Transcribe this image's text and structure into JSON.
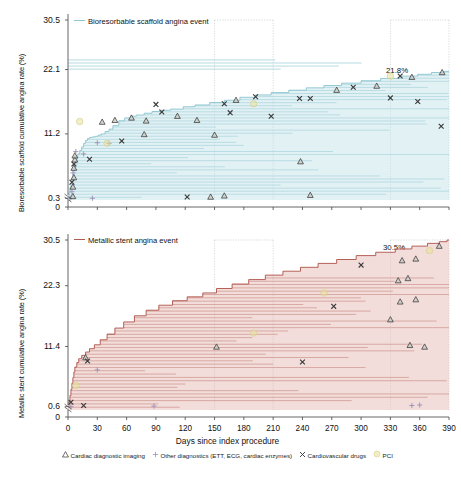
{
  "figure": {
    "xaxis": {
      "title": "Days since index procedure",
      "ticks": [
        0,
        30,
        60,
        90,
        120,
        150,
        180,
        210,
        240,
        270,
        300,
        330,
        360,
        390
      ],
      "min": 0,
      "max": 390
    },
    "marker_legend": [
      {
        "glyph": "triangle",
        "label": "Cardiac diagnostic imaging"
      },
      {
        "glyph": "plus",
        "label": "Other diagnostics (ETT, ECG, cardiac enzymes)"
      },
      {
        "glyph": "cross",
        "label": "Cardiovascular drugs"
      },
      {
        "glyph": "circle",
        "label": "PCI"
      }
    ],
    "colors": {
      "scaffold": "#8ec6d2",
      "scaffold_fill": "#bfe0e6",
      "stent": "#b05a50",
      "stent_fill": "#e3b4ad",
      "pci": "#e8e2a0",
      "gridline": "#bfc9cc",
      "axis": "#555555"
    }
  },
  "chart_data": [
    {
      "id": "top",
      "type": "area",
      "title": "Bioresorbable scaffold angina event",
      "ylabel": "Bioresorbable scaffold cumulative angina rate (%)",
      "xlabel": "Days since index procedure",
      "yticks": [
        0,
        0.3,
        11.2,
        22.1,
        30.5
      ],
      "ylim": [
        0,
        30.5
      ],
      "axis_break": true,
      "final_label": "21.8%",
      "final_value": 21.8,
      "grid": "vertical-dotted",
      "gridlines_x": [
        150,
        210,
        330,
        390
      ],
      "legend_position": "top-left-inline",
      "step_curve": {
        "x": [
          0,
          1,
          2,
          3,
          4,
          5,
          6,
          7,
          8,
          9,
          10,
          12,
          14,
          16,
          18,
          20,
          22,
          25,
          28,
          31,
          34,
          38,
          42,
          46,
          52,
          58,
          64,
          70,
          78,
          86,
          95,
          105,
          118,
          130,
          145,
          160,
          176,
          192,
          208,
          226,
          244,
          262,
          280,
          300,
          320,
          340,
          358,
          372,
          385,
          390
        ],
        "y": [
          0.3,
          1.2,
          2.1,
          2.9,
          3.6,
          4.3,
          5.0,
          5.7,
          6.4,
          7.1,
          7.8,
          8.4,
          9.0,
          9.6,
          10.1,
          10.4,
          10.6,
          10.7,
          10.8,
          11.0,
          11.2,
          11.6,
          12.0,
          12.6,
          13.4,
          13.9,
          14.2,
          14.4,
          14.7,
          15.0,
          15.2,
          15.4,
          15.8,
          16.1,
          16.5,
          16.9,
          17.4,
          17.8,
          18.2,
          18.6,
          19.0,
          19.4,
          19.8,
          20.2,
          20.6,
          21.0,
          21.3,
          21.6,
          21.8,
          21.8
        ]
      },
      "events": [
        {
          "x": 2,
          "y": 0.3,
          "glyph": "plus"
        },
        {
          "x": 5,
          "y": 0.6,
          "glyph": "triangle"
        },
        {
          "x": 4,
          "y": 1.4,
          "glyph": "plus"
        },
        {
          "x": 5,
          "y": 2.2,
          "glyph": "triangle"
        },
        {
          "x": 4,
          "y": 3.0,
          "glyph": "cross"
        },
        {
          "x": 6,
          "y": 3.8,
          "glyph": "triangle"
        },
        {
          "x": 5,
          "y": 4.6,
          "glyph": "plus"
        },
        {
          "x": 6,
          "y": 5.4,
          "glyph": "triangle"
        },
        {
          "x": 6,
          "y": 6.1,
          "glyph": "cross"
        },
        {
          "x": 7,
          "y": 6.8,
          "glyph": "triangle"
        },
        {
          "x": 7,
          "y": 7.5,
          "glyph": "triangle"
        },
        {
          "x": 8,
          "y": 8.2,
          "glyph": "plus"
        },
        {
          "x": 22,
          "y": 6.9,
          "glyph": "cross"
        },
        {
          "x": 16,
          "y": 7.8,
          "glyph": "plus"
        },
        {
          "x": 30,
          "y": 9.7,
          "glyph": "plus"
        },
        {
          "x": 42,
          "y": 9.6,
          "glyph": "plus"
        },
        {
          "x": 55,
          "y": 10.0,
          "glyph": "cross"
        },
        {
          "x": 78,
          "y": 11.1,
          "glyph": "triangle"
        },
        {
          "x": 35,
          "y": 13.2,
          "glyph": "triangle"
        },
        {
          "x": 48,
          "y": 13.5,
          "glyph": "triangle"
        },
        {
          "x": 65,
          "y": 13.9,
          "glyph": "triangle"
        },
        {
          "x": 80,
          "y": 13.4,
          "glyph": "triangle"
        },
        {
          "x": 96,
          "y": 14.9,
          "glyph": "cross"
        },
        {
          "x": 112,
          "y": 14.2,
          "glyph": "triangle"
        },
        {
          "x": 132,
          "y": 13.5,
          "glyph": "triangle"
        },
        {
          "x": 150,
          "y": 11.0,
          "glyph": "triangle"
        },
        {
          "x": 90,
          "y": 16.2,
          "glyph": "cross"
        },
        {
          "x": 160,
          "y": 16.3,
          "glyph": "cross"
        },
        {
          "x": 172,
          "y": 16.9,
          "glyph": "triangle"
        },
        {
          "x": 192,
          "y": 17.5,
          "glyph": "cross"
        },
        {
          "x": 166,
          "y": 14.8,
          "glyph": "cross"
        },
        {
          "x": 208,
          "y": 14.2,
          "glyph": "cross"
        },
        {
          "x": 237,
          "y": 17.2,
          "glyph": "cross"
        },
        {
          "x": 248,
          "y": 17.2,
          "glyph": "cross"
        },
        {
          "x": 275,
          "y": 18.6,
          "glyph": "triangle"
        },
        {
          "x": 292,
          "y": 19.1,
          "glyph": "cross"
        },
        {
          "x": 316,
          "y": 19.3,
          "glyph": "triangle"
        },
        {
          "x": 330,
          "y": 17.3,
          "glyph": "cross"
        },
        {
          "x": 340,
          "y": 21.0,
          "glyph": "cross"
        },
        {
          "x": 352,
          "y": 20.8,
          "glyph": "triangle"
        },
        {
          "x": 358,
          "y": 16.7,
          "glyph": "cross"
        },
        {
          "x": 383,
          "y": 21.6,
          "glyph": "triangle"
        },
        {
          "x": 382,
          "y": 12.5,
          "glyph": "cross"
        },
        {
          "x": 122,
          "y": 0.5,
          "glyph": "cross"
        },
        {
          "x": 146,
          "y": 0.5,
          "glyph": "triangle"
        },
        {
          "x": 160,
          "y": 0.7,
          "glyph": "triangle"
        },
        {
          "x": 238,
          "y": 6.5,
          "glyph": "triangle"
        },
        {
          "x": 248,
          "y": 0.8,
          "glyph": "triangle"
        },
        {
          "x": 25,
          "y": 0.3,
          "glyph": "plus"
        },
        {
          "x": 190,
          "y": 16.3,
          "glyph": "circle"
        },
        {
          "x": 12,
          "y": 13.3,
          "glyph": "circle"
        },
        {
          "x": 330,
          "y": 21.0,
          "glyph": "circle"
        },
        {
          "x": 40,
          "y": 9.6,
          "glyph": "circle"
        }
      ]
    },
    {
      "id": "bottom",
      "type": "area",
      "title": "Metallic stent angina event",
      "ylabel": "Metallic stent cumulative angina rate (%)",
      "xlabel": "Days since index procedure",
      "yticks": [
        0,
        0.6,
        11.4,
        22.3,
        30.5
      ],
      "ylim": [
        0,
        30.5
      ],
      "axis_break": true,
      "final_label": "30.5%",
      "final_value": 30.5,
      "grid": "vertical-dotted",
      "gridlines_x": [
        150,
        210,
        330,
        390
      ],
      "legend_position": "top-left-inline",
      "step_curve": {
        "x": [
          0,
          1,
          2,
          3,
          4,
          5,
          6,
          7,
          9,
          11,
          14,
          18,
          22,
          27,
          33,
          40,
          48,
          57,
          68,
          80,
          93,
          107,
          122,
          138,
          152,
          168,
          185,
          202,
          220,
          238,
          256,
          275,
          295,
          315,
          335,
          352,
          368,
          380,
          388,
          390
        ],
        "y": [
          0.6,
          1.5,
          2.6,
          3.7,
          4.8,
          5.8,
          6.8,
          7.7,
          8.5,
          9.2,
          9.8,
          10.4,
          11.0,
          11.7,
          12.6,
          13.6,
          14.7,
          15.8,
          16.9,
          17.9,
          18.8,
          19.6,
          20.3,
          21.0,
          21.8,
          22.6,
          23.4,
          24.2,
          24.9,
          25.6,
          26.3,
          27.0,
          27.7,
          28.3,
          28.9,
          29.4,
          29.9,
          30.2,
          30.5,
          30.5
        ]
      },
      "events": [
        {
          "x": 3,
          "y": 0.6,
          "glyph": "plus"
        },
        {
          "x": 3,
          "y": 1.4,
          "glyph": "cross"
        },
        {
          "x": 16,
          "y": 0.8,
          "glyph": "cross"
        },
        {
          "x": 88,
          "y": 0.7,
          "glyph": "plus"
        },
        {
          "x": 352,
          "y": 0.8,
          "glyph": "plus"
        },
        {
          "x": 360,
          "y": 0.9,
          "glyph": "plus"
        },
        {
          "x": 8,
          "y": 4.4,
          "glyph": "circle"
        },
        {
          "x": 30,
          "y": 7.2,
          "glyph": "plus"
        },
        {
          "x": 18,
          "y": 9.4,
          "glyph": "triangle"
        },
        {
          "x": 20,
          "y": 8.8,
          "glyph": "cross"
        },
        {
          "x": 152,
          "y": 11.3,
          "glyph": "triangle"
        },
        {
          "x": 240,
          "y": 8.6,
          "glyph": "cross"
        },
        {
          "x": 350,
          "y": 11.6,
          "glyph": "triangle"
        },
        {
          "x": 365,
          "y": 11.3,
          "glyph": "triangle"
        },
        {
          "x": 190,
          "y": 13.8,
          "glyph": "circle"
        },
        {
          "x": 330,
          "y": 16.2,
          "glyph": "triangle"
        },
        {
          "x": 272,
          "y": 18.6,
          "glyph": "cross"
        },
        {
          "x": 340,
          "y": 19.4,
          "glyph": "triangle"
        },
        {
          "x": 356,
          "y": 19.8,
          "glyph": "triangle"
        },
        {
          "x": 262,
          "y": 21.0,
          "glyph": "circle"
        },
        {
          "x": 338,
          "y": 23.2,
          "glyph": "triangle"
        },
        {
          "x": 348,
          "y": 23.6,
          "glyph": "triangle"
        },
        {
          "x": 300,
          "y": 26.0,
          "glyph": "cross"
        },
        {
          "x": 342,
          "y": 26.8,
          "glyph": "triangle"
        },
        {
          "x": 356,
          "y": 27.1,
          "glyph": "triangle"
        },
        {
          "x": 370,
          "y": 28.6,
          "glyph": "circle"
        },
        {
          "x": 380,
          "y": 29.4,
          "glyph": "triangle"
        }
      ]
    }
  ]
}
